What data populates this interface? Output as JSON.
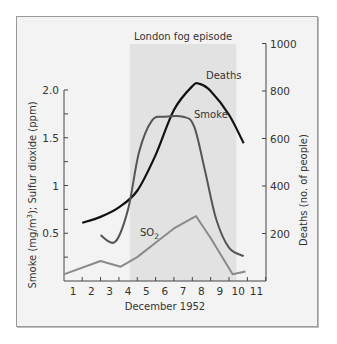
{
  "chart_data": {
    "type": "line",
    "title": "",
    "annotation": "London fog episode",
    "shaded_region": {
      "x_start": 4.1,
      "x_end": 9.9,
      "label": "London fog episode"
    },
    "xlabel": "December 1952",
    "ylabel_left": "Smoke (mg/m³); Sulfur dioxide (ppm)",
    "ylabel_right": "Deaths (no. of people)",
    "x_ticks": [
      "1",
      "2",
      "3",
      "4",
      "5",
      "6",
      "7",
      "8",
      "9",
      "10",
      "11"
    ],
    "y_left_ticks": [
      "0.5",
      "1",
      "1.5",
      "2.0"
    ],
    "y_right_ticks": [
      "200",
      "400",
      "600",
      "800",
      "1000"
    ],
    "xlim": [
      0.5,
      11.5
    ],
    "ylim_left": [
      0,
      2.0
    ],
    "ylim_right": [
      0,
      1000
    ],
    "grid": false,
    "series": [
      {
        "name": "Deaths",
        "axis": "right",
        "color": "#111111",
        "x": [
          1.5,
          2.5,
          3.5,
          4.5,
          5.5,
          6.5,
          7.5,
          7.9,
          8.5,
          9.5,
          10.3
        ],
        "values": [
          245,
          270,
          310,
          380,
          530,
          720,
          820,
          830,
          800,
          700,
          580
        ]
      },
      {
        "name": "Smoke",
        "axis": "left",
        "color": "#555555",
        "x": [
          2.5,
          3.3,
          4.0,
          4.6,
          5.3,
          6.0,
          7.0,
          7.6,
          8.2,
          8.8,
          9.5,
          10.3
        ],
        "values": [
          0.48,
          0.41,
          0.75,
          1.35,
          1.68,
          1.72,
          1.72,
          1.62,
          1.15,
          0.65,
          0.35,
          0.26
        ]
      },
      {
        "name": "SO2",
        "label": "SO",
        "label_sub": "2",
        "axis": "left",
        "color": "#8a8a8a",
        "x": [
          0.5,
          2.5,
          3.6,
          4.5,
          5.5,
          6.5,
          7.7,
          8.5,
          9.7,
          10.4
        ],
        "values": [
          0.07,
          0.21,
          0.15,
          0.25,
          0.4,
          0.55,
          0.68,
          0.45,
          0.07,
          0.1
        ]
      }
    ]
  }
}
